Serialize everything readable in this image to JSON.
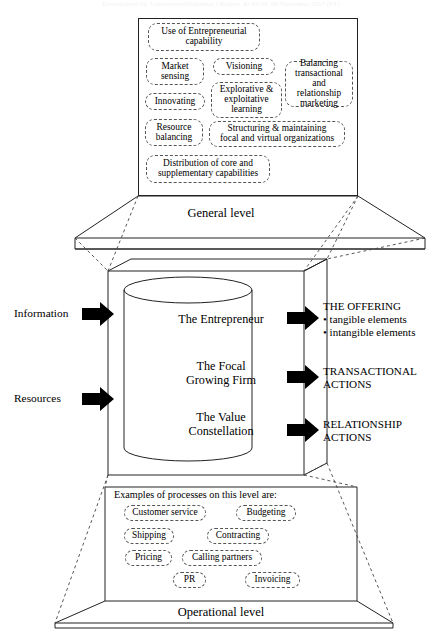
{
  "figure": {
    "watermark": "Downloaded by  Universitetsbiblioteket i Bergen  At 03:29  06 November 2017 (PT)",
    "general_level_label": "General level",
    "operational_level_label": "Operational level",
    "examples_heading": "Examples of processes on this level are:"
  },
  "general_level": {
    "boxes": [
      {
        "id": "use-of-entrepreneurial-capability",
        "text": "Use of Entrepreneurial\ncapability"
      },
      {
        "id": "market-sensing",
        "text": "Market\nsensing"
      },
      {
        "id": "visioning",
        "text": "Visioning"
      },
      {
        "id": "balancing-transactional-and-relationship-marketing",
        "text": "Balancing\ntransactional\nand relationship\nmarketing"
      },
      {
        "id": "innovating",
        "text": "Innovating"
      },
      {
        "id": "explorative-exploitative-learning",
        "text": "Explorative &\nexploitative\nlearning"
      },
      {
        "id": "resource-balancing",
        "text": "Resource\nbalancing"
      },
      {
        "id": "structuring-maintaining-focal-and-virtual-organizations",
        "text": "Structuring & maintaining\nfocal and virtual organizations"
      },
      {
        "id": "distribution-of-core-and-supplementary-capabilities",
        "text": "Distribution of core and\nsupplementary capabilities"
      }
    ]
  },
  "core": {
    "cylinder_labels": [
      {
        "id": "the-entrepreneur",
        "text": "The Entrepreneur"
      },
      {
        "id": "the-focal-growing-firm",
        "text": "The Focal\nGrowing Firm"
      },
      {
        "id": "the-value-constellation",
        "text": "The Value\nConstellation"
      }
    ],
    "inputs": [
      {
        "id": "information",
        "text": "Information"
      },
      {
        "id": "resources",
        "text": "Resources"
      }
    ],
    "outputs": [
      {
        "id": "the-offering",
        "text": "THE OFFERING\n• tangible elements\n• intangible elements"
      },
      {
        "id": "transactional-actions",
        "text": "TRANSACTIONAL\nACTIONS"
      },
      {
        "id": "relationship-actions",
        "text": "RELATIONSHIP\nACTIONS"
      }
    ]
  },
  "operational_level": {
    "boxes": [
      {
        "id": "customer-service",
        "text": "Customer service"
      },
      {
        "id": "budgeting",
        "text": "Budgeting"
      },
      {
        "id": "shipping",
        "text": "Shipping"
      },
      {
        "id": "contracting",
        "text": "Contracting"
      },
      {
        "id": "pricing",
        "text": "Pricing"
      },
      {
        "id": "calling-partners",
        "text": "Calling partners"
      },
      {
        "id": "pr",
        "text": "PR"
      },
      {
        "id": "invoicing",
        "text": "Invoicing"
      }
    ]
  },
  "colors": {
    "line": "#222222",
    "dashed": "#555555",
    "arrow": "#000000",
    "background": "#ffffff"
  }
}
